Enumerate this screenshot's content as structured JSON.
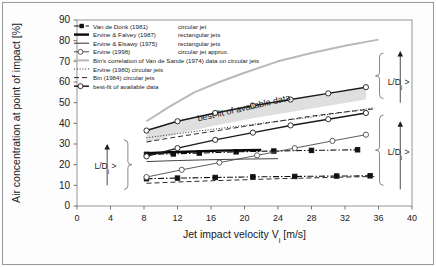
{
  "chart_data": {
    "type": "line",
    "title": "",
    "xlabel": "Jet impact velocity Vi [m/s]",
    "xlabel_main": "Jet impact velocity V",
    "xlabel_sub": "i",
    "xlabel_unit": " [m/s]",
    "ylabel": "Air concentration at point of impact [%]",
    "xlim": [
      0,
      40
    ],
    "ylim": [
      0,
      90
    ],
    "xticks": [
      0,
      4,
      8,
      12,
      16,
      20,
      24,
      28,
      32,
      36,
      40
    ],
    "yticks": [
      0,
      10,
      20,
      30,
      40,
      50,
      60,
      70,
      80,
      90
    ],
    "grid": false,
    "legend_position": "top-left-inside",
    "annotations": [
      {
        "name": "best-fit-callout",
        "text": "best-fit of available data",
        "x": 20,
        "y": 46,
        "rotation": -13
      },
      {
        "name": "ld-annotation-left",
        "text": "L/Dj >",
        "x": 3.6,
        "y": 20
      },
      {
        "name": "ld-annotation-right-upper",
        "text": "L/Dj >",
        "x": 37.5,
        "y": 62
      },
      {
        "name": "ld-annotation-right-lower",
        "text": "L/Dj >",
        "x": 37.5,
        "y": 28
      }
    ],
    "series": [
      {
        "name": "Van de Donk (1981)",
        "detail": "circular jet",
        "legend_label": "Van de Donk (1981)",
        "legend_note": "circular jet",
        "style": "dash-dot",
        "color": "#111111",
        "marker": "square-filled",
        "width": 1.1,
        "x": [
          8.3,
          11.5,
          14.6,
          19.0,
          23.5,
          28.0,
          33.5
        ],
        "y": [
          25.0,
          25.2,
          25.6,
          26.2,
          26.6,
          26.9,
          27.2
        ]
      },
      {
        "name": "Van de Donk (1981) lower",
        "detail": "circular jet",
        "legend_label": "",
        "legend_note": "",
        "style": "dash-dot",
        "color": "#111111",
        "marker": "square-filled",
        "width": 1.1,
        "x": [
          8.3,
          12.0,
          16.5,
          21.0,
          26.0,
          31.0,
          35.0
        ],
        "y": [
          13.2,
          13.5,
          13.8,
          14.1,
          14.3,
          14.5,
          14.6
        ]
      },
      {
        "name": "Ervine & Falvey (1987)",
        "detail": "rectangular jets",
        "legend_label": "Ervine & Falvey (1987)",
        "legend_note": "rectangular jets",
        "style": "solid-thick",
        "color": "#0a0a0a",
        "marker": "none",
        "width": 2.4,
        "x": [
          8.3,
          11.0,
          14.0,
          17.0,
          20.0,
          22.0
        ],
        "y": [
          25.6,
          26.0,
          26.4,
          26.8,
          27.0,
          27.1
        ]
      },
      {
        "name": "Ervine & Elsawy (1975)",
        "detail": "rectangular jets",
        "legend_label": "Ervine & Elsawy (1975)",
        "legend_note": "rectangular jets",
        "style": "solid-thin",
        "color": "#2e2e2e",
        "marker": "none",
        "width": 0.9,
        "x": [
          8.3,
          12.0,
          16.0,
          20.0,
          24.0
        ],
        "y": [
          21.5,
          22.0,
          22.4,
          22.7,
          22.9
        ]
      },
      {
        "name": "Ervine (1998)",
        "detail": "circular jet approx.",
        "legend_label": "Ervine (1998)",
        "legend_note": "circular jet approx.",
        "style": "solid-thin-marker",
        "color": "#4a4a4a",
        "marker": "circle-open",
        "width": 0.9,
        "x": [
          8.3,
          12.5,
          17.0,
          21.5,
          26.0,
          30.5,
          34.5
        ],
        "y": [
          14.0,
          17.5,
          21.0,
          24.5,
          28.0,
          31.5,
          34.5
        ]
      },
      {
        "name": "Bin's correlation of Van de Sande (1974) data on circular jets",
        "detail": "",
        "legend_label": "Bin's correlation of Van de Sande (1974) data on circular jets",
        "legend_note": "",
        "style": "solid-grey-thick",
        "color": "#b9b9b9",
        "marker": "none",
        "width": 2.0,
        "x": [
          8.3,
          11.0,
          14.0,
          17.0,
          20.0,
          24.0,
          28.0,
          32.0,
          36.0
        ],
        "y": [
          41.0,
          48.0,
          55.0,
          60.0,
          64.5,
          70.0,
          74.0,
          77.5,
          80.5
        ]
      },
      {
        "name": "Ervine (1980)",
        "detail": "circular jets",
        "legend_label": "Ervine (1980)",
        "legend_note": "circular jets",
        "style": "dotted",
        "color": "#2b2b2b",
        "marker": "none",
        "width": 1.0,
        "x": [
          8.3,
          12.0,
          16.0,
          20.0,
          24.0,
          28.0,
          32.0,
          35.5
        ],
        "y": [
          33.0,
          35.0,
          37.0,
          39.0,
          41.0,
          43.0,
          45.5,
          47.5
        ]
      },
      {
        "name": "Bin (1984)",
        "detail": "circular jets",
        "legend_label": "Bin (1984)",
        "legend_note": "circular jets",
        "style": "dashed",
        "color": "#2b2b2b",
        "marker": "none",
        "width": 1.0,
        "x": [
          8.3,
          12.0,
          16.0,
          20.0,
          24.0,
          28.0,
          32.0,
          35.5
        ],
        "y": [
          11.0,
          11.6,
          12.2,
          12.7,
          13.2,
          13.6,
          14.0,
          14.3
        ]
      },
      {
        "name": "Bin (1984) upper",
        "detail": "circular jets",
        "legend_label": "",
        "legend_note": "",
        "style": "dashed",
        "color": "#2b2b2b",
        "marker": "none",
        "width": 1.0,
        "x": [
          8.3,
          12.0,
          16.0,
          20.0,
          24.0,
          28.0,
          32.0,
          35.5
        ],
        "y": [
          31.0,
          33.5,
          36.0,
          38.5,
          41.0,
          43.5,
          45.5,
          47.0
        ]
      },
      {
        "name": "best-fit of available data (upper)",
        "detail": "",
        "legend_label": "best-fit of available data",
        "legend_note": "",
        "style": "solid-marker-thick",
        "color": "#1a1a1a",
        "marker": "circle-open",
        "width": 1.5,
        "x": [
          8.3,
          12.0,
          16.5,
          21.0,
          25.5,
          30.0,
          34.5
        ],
        "y": [
          36.5,
          41.0,
          45.0,
          48.5,
          51.5,
          54.5,
          57.5
        ]
      },
      {
        "name": "best-fit of available data (lower)",
        "detail": "",
        "legend_label": "",
        "legend_note": "",
        "style": "solid-marker-thick",
        "color": "#1a1a1a",
        "marker": "circle-open",
        "width": 1.5,
        "x": [
          8.3,
          12.0,
          16.5,
          21.0,
          25.5,
          30.0,
          34.5
        ],
        "y": [
          24.0,
          28.0,
          32.0,
          35.5,
          39.0,
          42.0,
          45.0
        ]
      }
    ],
    "band": {
      "name": "best-fit-uncertainty-band",
      "fill": "#d9d9d9",
      "x": [
        8.3,
        12.0,
        16.5,
        21.0,
        25.5,
        30.0,
        34.5
      ],
      "y_upper": [
        36.5,
        41.0,
        45.0,
        48.5,
        51.5,
        54.5,
        57.5
      ],
      "y_lower": [
        30.5,
        35.0,
        39.0,
        42.5,
        45.5,
        48.5,
        51.5
      ]
    }
  },
  "legend": {
    "entries": [
      {
        "label": "Van de Donk (1981)",
        "note": "circular jet",
        "style": "dash-dot-marker",
        "color": "#111111"
      },
      {
        "label": "Ervine & Falvey (1987)",
        "note": "rectangular jets",
        "style": "solid-thick",
        "color": "#0a0a0a"
      },
      {
        "label": "Ervine & Elsawy (1975)",
        "note": "rectangular jets",
        "style": "solid-thin",
        "color": "#2e2e2e"
      },
      {
        "label": "Ervine (1998)",
        "note": "circular jet approx.",
        "style": "solid-thin-marker",
        "color": "#4a4a4a"
      },
      {
        "label": "Bin's correlation of Van de Sande (1974) data on circular jets",
        "note": "",
        "style": "solid-grey-thick",
        "color": "#b9b9b9"
      },
      {
        "label": "Ervine (1980) circular jets",
        "note": "",
        "style": "dotted",
        "color": "#2b2b2b"
      },
      {
        "label": "Bin (1984) circular jets",
        "note": "",
        "style": "dashed",
        "color": "#2b2b2b"
      },
      {
        "label": "best-fit of available data",
        "note": "",
        "style": "solid-marker-thick",
        "color": "#1a1a1a"
      }
    ]
  },
  "axis_labels": {
    "y_title": "Air concentration at point of impact [%]",
    "x_title_main": "Jet impact velocity V",
    "x_title_sub": "i",
    "x_title_unit": " [m/s]"
  },
  "annotation_text": {
    "best_fit": "best-fit of available data",
    "ld_main": "L/D",
    "ld_sub": "j",
    "ld_gt": " >"
  },
  "colors": {
    "axis": "#555555",
    "frame": "#8a8a8a",
    "band_fill": "#d9d9d9",
    "grey_curve": "#b9b9b9",
    "text": "#1a1a1a"
  }
}
